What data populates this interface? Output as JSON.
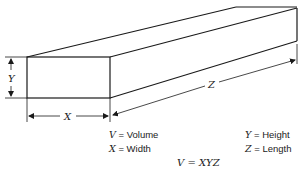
{
  "diagram": {
    "type": "rectangular-prism",
    "dimension_labels": {
      "height": "Y",
      "width": "X",
      "length": "Z"
    }
  },
  "legend": [
    {
      "symbol": "V",
      "eq": "=",
      "meaning": "Volume"
    },
    {
      "symbol": "X",
      "eq": "=",
      "meaning": "Width"
    },
    {
      "symbol": "Y",
      "eq": "=",
      "meaning": "Height"
    },
    {
      "symbol": "Z",
      "eq": "=",
      "meaning": "Length"
    }
  ],
  "formula": "V = XYZ",
  "colors": {
    "line": "#1a1a1a",
    "background": "#ffffff"
  }
}
